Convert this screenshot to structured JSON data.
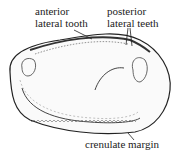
{
  "figure": {
    "labels": {
      "anterior_1": "anterior",
      "anterior_2": "lateral tooth",
      "posterior_1": "posterior",
      "posterior_2": "lateral teeth",
      "margin": "crenulate margin"
    },
    "colors": {
      "ink": "#222222",
      "background": "#ffffff"
    }
  }
}
